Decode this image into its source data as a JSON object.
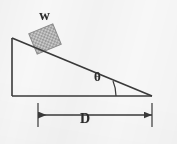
{
  "figure": {
    "canvas": {
      "width": 177,
      "height": 144
    },
    "background_color": "#f7f7f7",
    "stroke_color": "#3a3a3a"
  },
  "labels": {
    "weight": "W",
    "angle": "θ",
    "distance": "D"
  },
  "geometry": {
    "incline": {
      "apex": {
        "x": 12,
        "y": 38
      },
      "bottom_left": {
        "x": 12,
        "y": 96
      },
      "bottom_right": {
        "x": 152,
        "y": 96
      }
    },
    "block": {
      "center": {
        "x": 45,
        "y": 39
      },
      "width": 26,
      "height": 22,
      "fill": "#b9b9b9",
      "hatch": "checker"
    },
    "angle_arc": {
      "vertex": {
        "x": 152,
        "y": 96
      },
      "radius": 40
    },
    "dimension_line": {
      "y": 115,
      "x_start": 38,
      "x_end": 152
    }
  }
}
